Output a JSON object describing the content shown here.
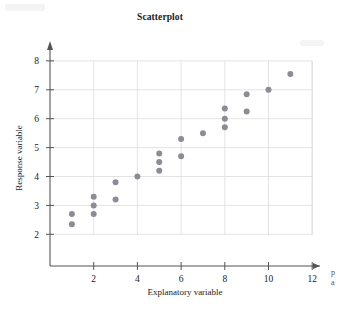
{
  "chart_data": {
    "type": "scatter",
    "title": "Scatterplot",
    "xlabel": "Explanatory variable",
    "ylabel": "Response variable",
    "xlim": [
      0,
      12.6
    ],
    "ylim": [
      1.55,
      8.45
    ],
    "xticks": [
      2,
      4,
      6,
      8,
      10,
      12
    ],
    "yticks": [
      2,
      3,
      4,
      5,
      6,
      7,
      8
    ],
    "grid": true,
    "legend": "none",
    "point_color": "#8c8c96",
    "point_radius": 3.0,
    "series": [
      {
        "name": "observations",
        "points": [
          [
            1,
            2.7
          ],
          [
            1,
            2.35
          ],
          [
            2,
            3.3
          ],
          [
            2,
            3.0
          ],
          [
            2,
            2.7
          ],
          [
            3,
            3.8
          ],
          [
            3,
            3.2
          ],
          [
            4,
            4.0
          ],
          [
            5,
            4.8
          ],
          [
            5,
            4.5
          ],
          [
            5,
            4.2
          ],
          [
            6,
            5.3
          ],
          [
            6,
            4.7
          ],
          [
            7,
            5.5
          ],
          [
            8,
            6.35
          ],
          [
            8,
            6.0
          ],
          [
            8,
            5.7
          ],
          [
            9,
            6.85
          ],
          [
            9,
            6.25
          ],
          [
            10,
            7.0
          ],
          [
            11,
            7.55
          ]
        ]
      }
    ]
  },
  "axes": {
    "x_axis_name": "x-axis",
    "y_axis_name": "y-axis"
  },
  "margin_note": {
    "line1": "p",
    "line2": "a"
  },
  "colors": {
    "point": "#8c8c96",
    "grid": "#dcdcdc",
    "axis": "#555555",
    "text": "#1b1b1b"
  }
}
